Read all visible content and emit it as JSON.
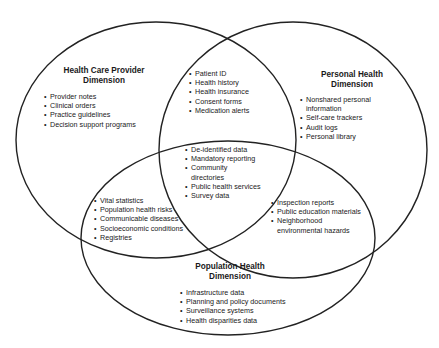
{
  "diagram": {
    "type": "venn",
    "stroke_color": "#222222",
    "circles": [
      {
        "id": "health-care-provider",
        "title_line1": "Health Care Provider",
        "title_line2": "Dimension",
        "items": [
          "Provider notes",
          "Clinical orders",
          "Practice guidelines",
          "Decision support programs"
        ]
      },
      {
        "id": "personal-health",
        "title_line1": "Personal Health",
        "title_line2": "Dimension",
        "items": [
          "Nonshared personal",
          "information",
          "Self-care trackers",
          "Audit logs",
          "Personal library"
        ]
      },
      {
        "id": "population-health",
        "title_line1": "Population Health",
        "title_line2": "Dimension",
        "items": [
          "Infrastructure data",
          "Planning and policy documents",
          "Surveillance systems",
          "Health disparities data"
        ]
      }
    ],
    "overlaps": {
      "provider_personal": [
        "Patient ID",
        "Health history",
        "Health insurance",
        "Consent forms",
        "Medication alerts"
      ],
      "all_three": [
        "De-identified data",
        "Mandatory reporting",
        "Community",
        "directories",
        "Public health services",
        "Survey data"
      ],
      "provider_population": [
        "Vital statistics",
        "Population health risks",
        "Communicable diseases",
        "Socioeconomic conditions",
        "Registries"
      ],
      "personal_population": [
        "Inspection reports",
        "Public education materials",
        "Neighborhood",
        "environmental hazards"
      ]
    }
  }
}
